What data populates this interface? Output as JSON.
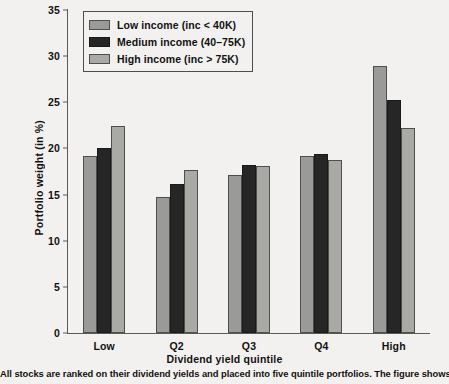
{
  "chart_data": {
    "type": "bar",
    "title": "",
    "xlabel": "Dividend yield quintile",
    "ylabel": "Portfolio weight (in %)",
    "categories": [
      "Low",
      "Q2",
      "Q3",
      "Q4",
      "High"
    ],
    "series": [
      {
        "name": "Low income (inc < 40K)",
        "color": "#9a9a98",
        "values": [
          19.2,
          14.7,
          17.1,
          19.2,
          28.9
        ]
      },
      {
        "name": "Medium income (40–75K)",
        "color": "#262626",
        "values": [
          20.1,
          16.2,
          18.2,
          19.4,
          25.3
        ]
      },
      {
        "name": "High income (inc > 75K)",
        "color": "#a9a9a6",
        "values": [
          22.4,
          17.7,
          18.1,
          18.8,
          22.2
        ]
      }
    ],
    "ylim": [
      0,
      35
    ],
    "yticks": [
      0,
      5,
      10,
      15,
      20,
      25,
      30,
      35
    ],
    "ytick_labels": [
      "0",
      "5",
      "10",
      "15",
      "20",
      "25",
      "30",
      "35"
    ],
    "grid": false,
    "legend_position": "top-left"
  },
  "legend": {
    "entries": [
      {
        "label": "Low income (inc < 40K)"
      },
      {
        "label": "Medium income (40–75K)"
      },
      {
        "label": "High income (inc > 75K)"
      }
    ]
  },
  "caption": {
    "text": "All stocks are ranked on their dividend yields and placed into five quintile portfolios. The figure shows the"
  }
}
